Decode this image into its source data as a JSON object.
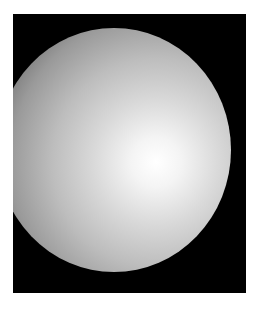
{
  "image": {
    "subject": "shaded-sphere",
    "background_color": "#000000",
    "frame_color": "#ffffff",
    "highlight_color": "#ffffff",
    "shadow_color": "#3a3a3a"
  }
}
